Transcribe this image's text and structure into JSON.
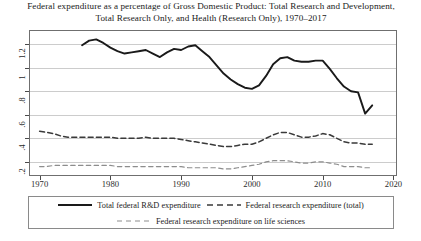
{
  "chart_data": {
    "type": "line",
    "title": "Federal expenditure as a percentage of Gross Domestic Product: Total Research and Development, Total Research Only, and Health (Research Only), 1970–2017",
    "xlabel": "",
    "ylabel": "",
    "xlim": [
      1968.5,
      2020.5
    ],
    "ylim": [
      0.08,
      1.32
    ],
    "grid": true,
    "legend_position": "below-plot",
    "xticks": [
      "1970",
      "1980",
      "1990",
      "2000",
      "2010",
      "2020"
    ],
    "xtick_values": [
      1970,
      1980,
      1990,
      2000,
      2010,
      2020
    ],
    "yticks": [
      ".2",
      ".4",
      ".6",
      ".8",
      "1",
      "1.2"
    ],
    "ytick_values": [
      0.2,
      0.4,
      0.6,
      0.8,
      1.0,
      1.2
    ],
    "series": [
      {
        "name": "Total federal R&D expenditure",
        "style": "solid",
        "color": "#1a1a1a",
        "x": [
          1976,
          1977,
          1978,
          1979,
          1980,
          1981,
          1982,
          1983,
          1984,
          1985,
          1986,
          1987,
          1988,
          1989,
          1990,
          1991,
          1992,
          1993,
          1994,
          1995,
          1996,
          1997,
          1998,
          1999,
          2000,
          2001,
          2002,
          2003,
          2004,
          2005,
          2006,
          2007,
          2008,
          2009,
          2010,
          2011,
          2012,
          2013,
          2014,
          2015,
          2016,
          2017
        ],
        "values": [
          1.19,
          1.23,
          1.24,
          1.21,
          1.17,
          1.14,
          1.12,
          1.13,
          1.14,
          1.15,
          1.12,
          1.09,
          1.13,
          1.16,
          1.15,
          1.18,
          1.19,
          1.14,
          1.09,
          1.02,
          0.95,
          0.9,
          0.86,
          0.83,
          0.82,
          0.85,
          0.93,
          1.03,
          1.08,
          1.09,
          1.06,
          1.05,
          1.05,
          1.06,
          1.06,
          0.99,
          0.91,
          0.84,
          0.8,
          0.79,
          0.61,
          0.68
        ]
      },
      {
        "name": "Federal research expenditure (total)",
        "style": "dashed",
        "color": "#3a3a3a",
        "x": [
          1970,
          1971,
          1972,
          1973,
          1974,
          1975,
          1976,
          1977,
          1978,
          1979,
          1980,
          1981,
          1982,
          1983,
          1984,
          1985,
          1986,
          1987,
          1988,
          1989,
          1990,
          1991,
          1992,
          1993,
          1994,
          1995,
          1996,
          1997,
          1998,
          1999,
          2000,
          2001,
          2002,
          2003,
          2004,
          2005,
          2006,
          2007,
          2008,
          2009,
          2010,
          2011,
          2012,
          2013,
          2014,
          2015,
          2016,
          2017
        ],
        "values": [
          0.46,
          0.45,
          0.44,
          0.42,
          0.41,
          0.41,
          0.41,
          0.41,
          0.41,
          0.41,
          0.41,
          0.4,
          0.4,
          0.4,
          0.4,
          0.41,
          0.4,
          0.4,
          0.4,
          0.4,
          0.39,
          0.38,
          0.37,
          0.36,
          0.35,
          0.34,
          0.33,
          0.33,
          0.34,
          0.35,
          0.35,
          0.37,
          0.4,
          0.43,
          0.45,
          0.45,
          0.43,
          0.41,
          0.41,
          0.42,
          0.44,
          0.43,
          0.4,
          0.37,
          0.36,
          0.36,
          0.35,
          0.35
        ]
      },
      {
        "name": "Federal research expenditure on life sciences",
        "style": "dashed-light",
        "color": "#8d8d8d",
        "x": [
          1970,
          1971,
          1972,
          1973,
          1974,
          1975,
          1976,
          1977,
          1978,
          1979,
          1980,
          1981,
          1982,
          1983,
          1984,
          1985,
          1986,
          1987,
          1988,
          1989,
          1990,
          1991,
          1992,
          1993,
          1994,
          1995,
          1996,
          1997,
          1998,
          1999,
          2000,
          2001,
          2002,
          2003,
          2004,
          2005,
          2006,
          2007,
          2008,
          2009,
          2010,
          2011,
          2012,
          2013,
          2014,
          2015,
          2016,
          2017
        ],
        "values": [
          0.16,
          0.16,
          0.17,
          0.17,
          0.17,
          0.17,
          0.17,
          0.17,
          0.17,
          0.17,
          0.17,
          0.16,
          0.16,
          0.16,
          0.16,
          0.16,
          0.16,
          0.16,
          0.16,
          0.16,
          0.16,
          0.15,
          0.15,
          0.15,
          0.15,
          0.15,
          0.14,
          0.14,
          0.15,
          0.16,
          0.17,
          0.18,
          0.2,
          0.21,
          0.21,
          0.21,
          0.2,
          0.19,
          0.19,
          0.2,
          0.2,
          0.19,
          0.18,
          0.16,
          0.16,
          0.16,
          0.15,
          0.15
        ]
      }
    ]
  },
  "legend": {
    "entries": [
      {
        "label": "Total federal R&D expenditure",
        "style": "solid"
      },
      {
        "label": "Federal research expenditure (total)",
        "style": "dashed"
      },
      {
        "label": "Federal research expenditure on life sciences",
        "style": "dashed-light"
      }
    ]
  }
}
